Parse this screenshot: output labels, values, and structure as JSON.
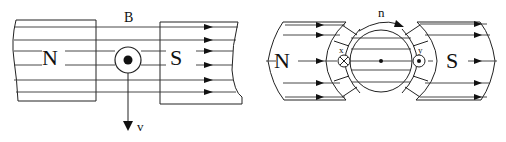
{
  "figures": [
    {
      "id": "left",
      "description": "Conductor moving between magnet poles in uniform field",
      "labels": {
        "field": "B",
        "north_pole": "N",
        "south_pole": "S",
        "velocity": "v"
      },
      "conductor_current": "out-of-page (dot)",
      "field_lines_count": 6
    },
    {
      "id": "right",
      "description": "Rotor between curved pole faces with two conductors",
      "labels": {
        "rotation": "n",
        "north_pole": "N",
        "south_pole": "S",
        "conductor_left": "x",
        "conductor_right": "y"
      },
      "conductor_left_current": "into-page (cross)",
      "conductor_right_current": "out-of-page (dot)"
    }
  ],
  "colors": {
    "stroke": "#222222",
    "background": "#ffffff"
  }
}
